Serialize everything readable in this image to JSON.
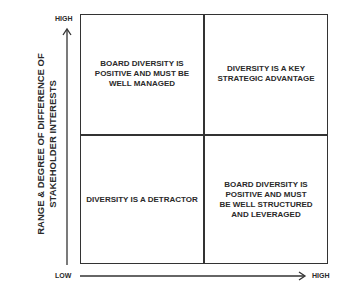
{
  "diagram": {
    "type": "2x2-matrix",
    "y_axis": {
      "label_line1": "RANGE & DEGREE OF DIFFERENCE OF",
      "label_line2": "STAKEHOLDER INTERESTS",
      "high": "HIGH",
      "low": "LOW"
    },
    "x_axis": {
      "low": "LOW",
      "high": "HIGH"
    },
    "quadrants": {
      "top_left": [
        "BOARD DIVERSITY IS",
        "POSITIVE AND MUST BE",
        "WELL MANAGED"
      ],
      "top_right": [
        "DIVERSITY IS A KEY",
        "STRATEGIC ADVANTAGE"
      ],
      "bottom_left": [
        "DIVERSITY IS A DETRACTOR"
      ],
      "bottom_right": [
        "BOARD DIVERSITY IS",
        "POSITIVE AND MUST",
        "BE WELL STRUCTURED",
        "AND LEVERAGED"
      ]
    },
    "colors": {
      "line": "#333333",
      "text": "#2a2a2a",
      "background": "#ffffff"
    }
  }
}
